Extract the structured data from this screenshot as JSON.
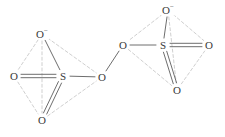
{
  "figure": {
    "title": "Disulfate-type chain: two tetrahedral SO4 units bridged by oxygen",
    "background_color": "#ffffff",
    "bond_color": "#6e6e6e",
    "tetrahedron_edge_color": "#c9c9c9",
    "label_color": "#3a3a3a"
  },
  "atoms": [
    {
      "id": "a1",
      "element": "O",
      "charge": "−",
      "display": "O",
      "x": 42,
      "y": 34
    },
    {
      "id": "a2",
      "element": "O",
      "charge": "",
      "display": "O",
      "x": 14,
      "y": 76
    },
    {
      "id": "a3",
      "element": "S",
      "charge": "",
      "display": "S",
      "x": 63,
      "y": 76
    },
    {
      "id": "a4",
      "element": "O",
      "charge": "",
      "display": "O",
      "x": 42,
      "y": 120
    },
    {
      "id": "a5",
      "element": "O",
      "charge": "",
      "display": "O",
      "x": 102,
      "y": 77
    },
    {
      "id": "a6",
      "element": "O",
      "charge": "",
      "display": "O",
      "x": 123,
      "y": 45
    },
    {
      "id": "a7",
      "element": "S",
      "charge": "",
      "display": "S",
      "x": 163,
      "y": 45
    },
    {
      "id": "a8",
      "element": "O",
      "charge": "−",
      "display": "O",
      "x": 168,
      "y": 10
    },
    {
      "id": "a9",
      "element": "O",
      "charge": "",
      "display": "O",
      "x": 209,
      "y": 45
    },
    {
      "id": "a10",
      "element": "O",
      "charge": "",
      "display": "O",
      "x": 177,
      "y": 90
    }
  ],
  "bonds": [
    {
      "from": "a1",
      "to": "a3",
      "order": 1,
      "style": "solid"
    },
    {
      "from": "a2",
      "to": "a3",
      "order": 2,
      "style": "solid"
    },
    {
      "from": "a3",
      "to": "a4",
      "order": 2,
      "style": "solid"
    },
    {
      "from": "a3",
      "to": "a5",
      "order": 1,
      "style": "solid"
    },
    {
      "from": "a5",
      "to": "a6",
      "order": 1,
      "style": "solid"
    },
    {
      "from": "a6",
      "to": "a7",
      "order": 1,
      "style": "solid"
    },
    {
      "from": "a7",
      "to": "a8",
      "order": 1,
      "style": "solid"
    },
    {
      "from": "a7",
      "to": "a9",
      "order": 2,
      "style": "solid"
    },
    {
      "from": "a7",
      "to": "a10",
      "order": 2,
      "style": "solid"
    }
  ],
  "tetrahedron_edges": [
    {
      "from": "a1",
      "to": "a2"
    },
    {
      "from": "a1",
      "to": "a4"
    },
    {
      "from": "a1",
      "to": "a5"
    },
    {
      "from": "a2",
      "to": "a4"
    },
    {
      "from": "a4",
      "to": "a5"
    },
    {
      "from": "a8",
      "to": "a6"
    },
    {
      "from": "a8",
      "to": "a9"
    },
    {
      "from": "a8",
      "to": "a10"
    },
    {
      "from": "a6",
      "to": "a10"
    },
    {
      "from": "a9",
      "to": "a10"
    }
  ],
  "charge_symbol": "−"
}
